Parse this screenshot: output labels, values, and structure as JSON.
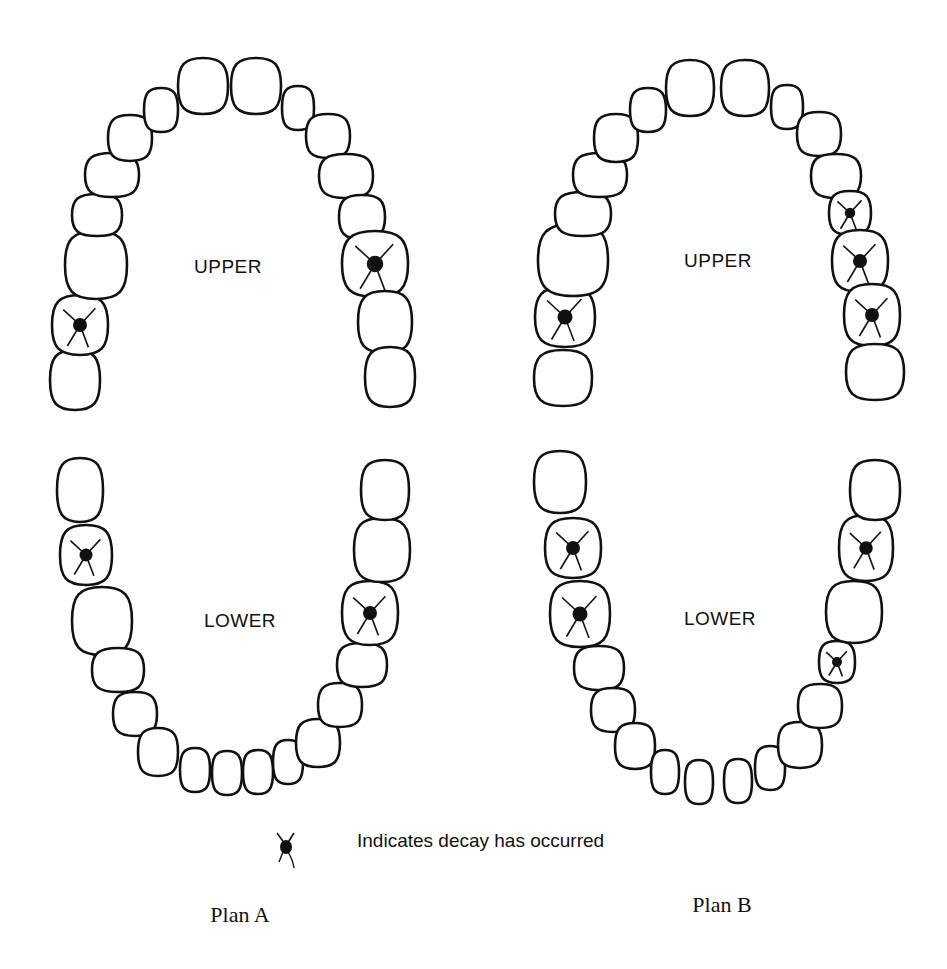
{
  "legend": {
    "symbol": "decay-marker",
    "text": "Indicates decay has occurred"
  },
  "plans": [
    {
      "label": "Plan A",
      "label_pos": [
        240,
        915
      ],
      "arches": [
        {
          "label": "UPPER",
          "label_pos": [
            228,
            277
          ],
          "teeth": [
            {
              "x": 75,
              "y": 380,
              "rx": 25,
              "ry": 30,
              "decay": false
            },
            {
              "x": 80,
              "y": 325,
              "rx": 28,
              "ry": 30,
              "decay": true
            },
            {
              "x": 96,
              "y": 265,
              "rx": 31,
              "ry": 34,
              "decay": false
            },
            {
              "x": 97,
              "y": 215,
              "rx": 25,
              "ry": 21,
              "decay": false
            },
            {
              "x": 112,
              "y": 175,
              "rx": 27,
              "ry": 22,
              "decay": false
            },
            {
              "x": 130,
              "y": 138,
              "rx": 22,
              "ry": 23,
              "decay": false
            },
            {
              "x": 161,
              "y": 110,
              "rx": 17,
              "ry": 22,
              "decay": false
            },
            {
              "x": 203,
              "y": 86,
              "rx": 25,
              "ry": 28,
              "decay": false
            },
            {
              "x": 256,
              "y": 86,
              "rx": 25,
              "ry": 28,
              "decay": false
            },
            {
              "x": 298,
              "y": 108,
              "rx": 16,
              "ry": 22,
              "decay": false
            },
            {
              "x": 328,
              "y": 136,
              "rx": 22,
              "ry": 22,
              "decay": false
            },
            {
              "x": 346,
              "y": 176,
              "rx": 27,
              "ry": 22,
              "decay": false
            },
            {
              "x": 362,
              "y": 217,
              "rx": 23,
              "ry": 22,
              "decay": false
            },
            {
              "x": 375,
              "y": 264,
              "rx": 33,
              "ry": 33,
              "decay": true
            },
            {
              "x": 385,
              "y": 322,
              "rx": 27,
              "ry": 31,
              "decay": false
            },
            {
              "x": 390,
              "y": 377,
              "rx": 25,
              "ry": 30,
              "decay": false
            }
          ]
        },
        {
          "label": "LOWER",
          "label_pos": [
            240,
            622
          ],
          "teeth": [
            {
              "x": 80,
              "y": 490,
              "rx": 23,
              "ry": 32,
              "decay": false
            },
            {
              "x": 86,
              "y": 555,
              "rx": 26,
              "ry": 30,
              "decay": true
            },
            {
              "x": 102,
              "y": 621,
              "rx": 30,
              "ry": 34,
              "decay": false
            },
            {
              "x": 118,
              "y": 670,
              "rx": 26,
              "ry": 22,
              "decay": false
            },
            {
              "x": 135,
              "y": 714,
              "rx": 22,
              "ry": 22,
              "decay": false
            },
            {
              "x": 158,
              "y": 752,
              "rx": 20,
              "ry": 24,
              "decay": false
            },
            {
              "x": 195,
              "y": 770,
              "rx": 15,
              "ry": 22,
              "decay": false
            },
            {
              "x": 227,
              "y": 773,
              "rx": 15,
              "ry": 22,
              "decay": false
            },
            {
              "x": 258,
              "y": 772,
              "rx": 15,
              "ry": 22,
              "decay": false
            },
            {
              "x": 288,
              "y": 762,
              "rx": 15,
              "ry": 22,
              "decay": false
            },
            {
              "x": 318,
              "y": 743,
              "rx": 22,
              "ry": 24,
              "decay": false
            },
            {
              "x": 340,
              "y": 705,
              "rx": 22,
              "ry": 22,
              "decay": false
            },
            {
              "x": 362,
              "y": 665,
              "rx": 25,
              "ry": 22,
              "decay": false
            },
            {
              "x": 370,
              "y": 613,
              "rx": 28,
              "ry": 32,
              "decay": true
            },
            {
              "x": 382,
              "y": 550,
              "rx": 28,
              "ry": 32,
              "decay": false
            },
            {
              "x": 385,
              "y": 490,
              "rx": 24,
              "ry": 30,
              "decay": false
            }
          ]
        }
      ]
    },
    {
      "label": "Plan B",
      "label_pos": [
        722,
        905
      ],
      "arches": [
        {
          "label": "UPPER",
          "label_pos": [
            718,
            270
          ],
          "teeth": [
            {
              "x": 563,
              "y": 378,
              "rx": 29,
              "ry": 28,
              "decay": false
            },
            {
              "x": 565,
              "y": 317,
              "rx": 30,
              "ry": 30,
              "decay": true
            },
            {
              "x": 573,
              "y": 260,
              "rx": 35,
              "ry": 36,
              "decay": false
            },
            {
              "x": 583,
              "y": 214,
              "rx": 28,
              "ry": 22,
              "decay": false
            },
            {
              "x": 600,
              "y": 175,
              "rx": 27,
              "ry": 22,
              "decay": false
            },
            {
              "x": 616,
              "y": 138,
              "rx": 22,
              "ry": 24,
              "decay": false
            },
            {
              "x": 648,
              "y": 110,
              "rx": 18,
              "ry": 22,
              "decay": false
            },
            {
              "x": 690,
              "y": 88,
              "rx": 24,
              "ry": 28,
              "decay": false
            },
            {
              "x": 745,
              "y": 88,
              "rx": 24,
              "ry": 28,
              "decay": false
            },
            {
              "x": 787,
              "y": 107,
              "rx": 16,
              "ry": 22,
              "decay": false
            },
            {
              "x": 819,
              "y": 134,
              "rx": 22,
              "ry": 22,
              "decay": false
            },
            {
              "x": 836,
              "y": 176,
              "rx": 25,
              "ry": 22,
              "decay": false
            },
            {
              "x": 850,
              "y": 213,
              "rx": 21,
              "ry": 22,
              "decay": true
            },
            {
              "x": 860,
              "y": 261,
              "rx": 28,
              "ry": 31,
              "decay": true
            },
            {
              "x": 872,
              "y": 315,
              "rx": 28,
              "ry": 31,
              "decay": true
            },
            {
              "x": 875,
              "y": 372,
              "rx": 29,
              "ry": 28,
              "decay": false
            }
          ]
        },
        {
          "label": "LOWER",
          "label_pos": [
            720,
            619
          ],
          "teeth": [
            {
              "x": 560,
              "y": 482,
              "rx": 26,
              "ry": 31,
              "decay": false
            },
            {
              "x": 573,
              "y": 548,
              "rx": 28,
              "ry": 30,
              "decay": true
            },
            {
              "x": 580,
              "y": 614,
              "rx": 30,
              "ry": 33,
              "decay": true
            },
            {
              "x": 599,
              "y": 668,
              "rx": 25,
              "ry": 22,
              "decay": false
            },
            {
              "x": 613,
              "y": 710,
              "rx": 22,
              "ry": 22,
              "decay": false
            },
            {
              "x": 635,
              "y": 746,
              "rx": 20,
              "ry": 23,
              "decay": false
            },
            {
              "x": 665,
              "y": 772,
              "rx": 14,
              "ry": 22,
              "decay": false
            },
            {
              "x": 699,
              "y": 782,
              "rx": 14,
              "ry": 22,
              "decay": false
            },
            {
              "x": 738,
              "y": 781,
              "rx": 14,
              "ry": 22,
              "decay": false
            },
            {
              "x": 770,
              "y": 768,
              "rx": 15,
              "ry": 22,
              "decay": false
            },
            {
              "x": 800,
              "y": 745,
              "rx": 22,
              "ry": 23,
              "decay": false
            },
            {
              "x": 820,
              "y": 706,
              "rx": 22,
              "ry": 22,
              "decay": false
            },
            {
              "x": 837,
              "y": 662,
              "rx": 18,
              "ry": 21,
              "decay": true
            },
            {
              "x": 854,
              "y": 612,
              "rx": 28,
              "ry": 31,
              "decay": false
            },
            {
              "x": 866,
              "y": 548,
              "rx": 27,
              "ry": 33,
              "decay": true
            },
            {
              "x": 875,
              "y": 490,
              "rx": 25,
              "ry": 30,
              "decay": false
            }
          ]
        }
      ]
    }
  ]
}
